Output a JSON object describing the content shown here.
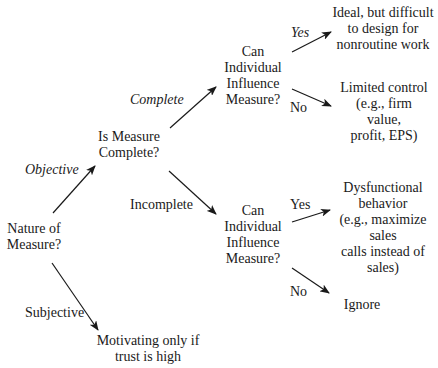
{
  "diagram": {
    "type": "decision-tree",
    "colors": {
      "background": "#ffffff",
      "text": "#1a1a1a",
      "arrow": "#1a1a1a"
    },
    "nodes": {
      "root": {
        "lines": [
          "Nature of",
          "Measure?"
        ]
      },
      "complete_q": {
        "lines": [
          "Is Measure",
          "Complete?"
        ]
      },
      "influence_top": {
        "lines": [
          "Can",
          "Individual",
          "Influence",
          "Measure?"
        ]
      },
      "influence_bottom": {
        "lines": [
          "Can",
          "Individual",
          "Influence",
          "Measure?"
        ]
      },
      "ideal": {
        "lines": [
          "Ideal, but difficult",
          "to design for",
          "nonroutine work"
        ]
      },
      "limited": {
        "lines": [
          "Limited control",
          "(e.g., firm",
          "value,",
          "profit, EPS)"
        ]
      },
      "dysfunctional": {
        "lines": [
          "Dysfunctional",
          "behavior",
          "(e.g., maximize",
          "sales",
          "calls instead of",
          "sales)"
        ]
      },
      "ignore": {
        "lines": [
          "Ignore"
        ]
      },
      "motivating": {
        "lines": [
          "Motivating only if",
          "trust is high"
        ]
      }
    },
    "edges": {
      "objective": {
        "label": "Objective",
        "from": "root",
        "to": "complete_q"
      },
      "subjective": {
        "label": "Subjective",
        "from": "root",
        "to": "motivating"
      },
      "complete": {
        "label": "Complete",
        "from": "complete_q",
        "to": "influence_top"
      },
      "incomplete": {
        "label": "Incomplete",
        "from": "complete_q",
        "to": "influence_bottom"
      },
      "yes_top": {
        "label": "Yes",
        "from": "influence_top",
        "to": "ideal"
      },
      "no_top": {
        "label": "No",
        "from": "influence_top",
        "to": "limited"
      },
      "yes_bottom": {
        "label": "Yes",
        "from": "influence_bottom",
        "to": "dysfunctional"
      },
      "no_bottom": {
        "label": "No",
        "from": "influence_bottom",
        "to": "ignore"
      }
    }
  }
}
